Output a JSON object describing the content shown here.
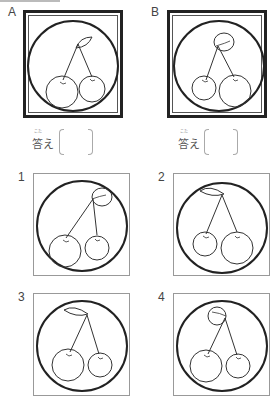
{
  "panels": {
    "A": {
      "label": "A",
      "answer_label": "答え",
      "answer_furigana": "こた",
      "answer_value": ""
    },
    "B": {
      "label": "B",
      "answer_label": "答え",
      "answer_furigana": "こた",
      "answer_value": ""
    }
  },
  "options": [
    {
      "label": "1"
    },
    {
      "label": "2"
    },
    {
      "label": "3"
    },
    {
      "label": "4"
    }
  ],
  "colors": {
    "line": "#222222",
    "frame": "#222222",
    "thin_frame": "#999999"
  }
}
